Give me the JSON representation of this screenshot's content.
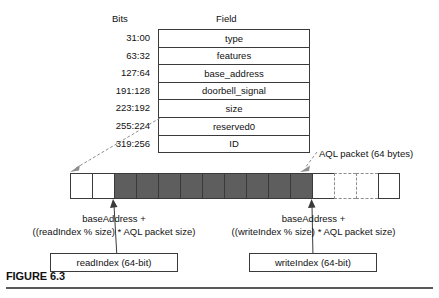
{
  "figure": {
    "caption": "FIGURE 6.3",
    "headers": {
      "bits": "Bits",
      "field": "Field"
    },
    "struct_rows": [
      {
        "bits": "31:00",
        "field": "type"
      },
      {
        "bits": "63:32",
        "field": "features"
      },
      {
        "bits": "127:64",
        "field": "base_address"
      },
      {
        "bits": "191:128",
        "field": "doorbell_signal"
      },
      {
        "bits": "223:192",
        "field": "size"
      },
      {
        "bits": "255:224",
        "field": "reserved0"
      },
      {
        "bits": "319:256",
        "field": "ID"
      }
    ],
    "ring_buffer": {
      "cells": [
        {
          "style": "white"
        },
        {
          "style": "white"
        },
        {
          "style": "shaded"
        },
        {
          "style": "shaded"
        },
        {
          "style": "shaded"
        },
        {
          "style": "shaded"
        },
        {
          "style": "shaded"
        },
        {
          "style": "shaded"
        },
        {
          "style": "shaded"
        },
        {
          "style": "shaded"
        },
        {
          "style": "shaded"
        },
        {
          "style": "white"
        },
        {
          "style": "dashed"
        },
        {
          "style": "dashed"
        },
        {
          "style": "white"
        }
      ]
    },
    "aql_callout": "AQL packet (64 bytes)",
    "read_pointer": {
      "line1": "baseAddress +",
      "line2": "((readIndex % size) * AQL packet size)",
      "box_label": "readIndex (64-bit)"
    },
    "write_pointer": {
      "line1": "baseAddress +",
      "line2": "((writeIndex % size) * AQL packet size)",
      "box_label": "writeIndex (64-bit)"
    },
    "colors": {
      "shaded_cell": "#5e5e5e",
      "stroke": "#3a3a3a",
      "dashed_stroke": "#8e8e8e",
      "text": "#111111"
    }
  }
}
